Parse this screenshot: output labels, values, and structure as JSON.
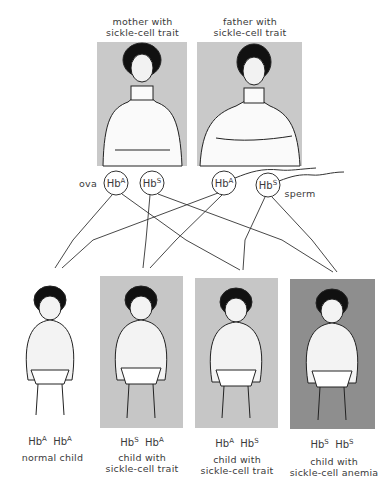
{
  "parents": {
    "mother": {
      "label": "mother with sickle-cell trait",
      "line1": "mother with",
      "line2": "sickle-cell trait",
      "panel_color": "#c9c9c9"
    },
    "father": {
      "label": "father with sickle-cell trait",
      "line1": "father with",
      "line2": "sickle-cell trait",
      "panel_color": "#c9c9c9"
    }
  },
  "gametes": {
    "ova_label": "ova",
    "sperm_label": "sperm",
    "ova": [
      {
        "base": "Hb",
        "allele": "A"
      },
      {
        "base": "Hb",
        "allele": "S"
      }
    ],
    "sperm": [
      {
        "base": "Hb",
        "allele": "A"
      },
      {
        "base": "Hb",
        "allele": "S"
      }
    ]
  },
  "children": [
    {
      "genotype": {
        "a1": "A",
        "a2": "A"
      },
      "line1": "normal child",
      "line2": "",
      "panel_color": "#ffffff"
    },
    {
      "genotype": {
        "a1": "S",
        "a2": "A"
      },
      "line1": "child with",
      "line2": "sickle-cell trait",
      "panel_color": "#c6c6c6"
    },
    {
      "genotype": {
        "a1": "A",
        "a2": "S"
      },
      "line1": "child with",
      "line2": "sickle-cell trait",
      "panel_color": "#c6c6c6"
    },
    {
      "genotype": {
        "a1": "S",
        "a2": "S"
      },
      "line1": "child with",
      "line2": "sickle-cell anemia",
      "panel_color": "#8e8e8e"
    }
  ],
  "hb": "Hb"
}
